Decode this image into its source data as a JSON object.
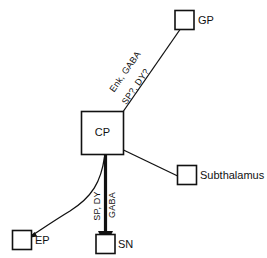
{
  "diagram": {
    "background_color": "#ffffff",
    "stroke_color": "#111111",
    "nodes": [
      {
        "id": "gp",
        "label": "GP",
        "inside_label": "",
        "label_position": "right"
      },
      {
        "id": "cp",
        "label": "",
        "inside_label": "CP",
        "label_position": "inside"
      },
      {
        "id": "subthalamus",
        "label": "Subthalamus",
        "inside_label": "",
        "label_position": "right"
      },
      {
        "id": "ep",
        "label": "EP",
        "inside_label": "",
        "label_position": "right"
      },
      {
        "id": "sn",
        "label": "SN",
        "inside_label": "",
        "label_position": "right"
      }
    ],
    "edges": [
      {
        "id": "cp-to-gp",
        "from": "cp",
        "to": "gp",
        "style": "solid-thin",
        "labels": [
          "Enk, GABA",
          "SP?, DY?"
        ]
      },
      {
        "id": "cp-to-subthalamus",
        "from": "cp",
        "to": "subthalamus",
        "style": "solid-thin",
        "labels": []
      },
      {
        "id": "cp-to-sn",
        "from": "cp",
        "to": "sn",
        "style": "solid-thick",
        "labels": [
          "SP, DY",
          "GABA"
        ]
      },
      {
        "id": "cp-to-ep",
        "from": "cp",
        "to": "ep",
        "style": "curved-thin",
        "labels": []
      }
    ],
    "edge_label_text": {
      "gp_line1": "Enk, GABA",
      "gp_line2": "SP?, DY?",
      "sn_line1": "SP, DY",
      "sn_line2": "GABA"
    }
  }
}
